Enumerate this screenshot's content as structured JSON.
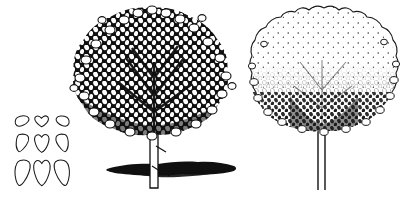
{
  "plate": {
    "title": "Tree rendering plate",
    "background_color": "#ffffff",
    "ink_color": "#111111",
    "medium": "pen-and-ink line drawing",
    "width": 403,
    "height": 198
  },
  "figures": [
    {
      "id": "leaf-chart",
      "name": "leaf-outline-grid",
      "label": "",
      "description": "Three-by-three grid of outlined leaf shapes, increasing in size from top row to bottom row",
      "rows": 3,
      "columns": 3,
      "fill": "none",
      "stroke_color": "#1a1a1a",
      "cells": [
        {
          "row": 1,
          "column": 1,
          "shape": "ovate-leaf-small",
          "size": "small"
        },
        {
          "row": 1,
          "column": 2,
          "shape": "cordate-leaf-small",
          "size": "small"
        },
        {
          "row": 1,
          "column": 3,
          "shape": "falcate-leaf-small",
          "size": "small"
        },
        {
          "row": 2,
          "column": 1,
          "shape": "ovate-leaf-medium",
          "size": "medium"
        },
        {
          "row": 2,
          "column": 2,
          "shape": "cordate-leaf-medium",
          "size": "medium"
        },
        {
          "row": 2,
          "column": 3,
          "shape": "falcate-leaf-medium",
          "size": "medium"
        },
        {
          "row": 3,
          "column": 1,
          "shape": "ovate-leaf-large",
          "size": "large"
        },
        {
          "row": 3,
          "column": 2,
          "shape": "cordate-leaf-large",
          "size": "large"
        },
        {
          "row": 3,
          "column": 3,
          "shape": "falcate-leaf-large",
          "size": "large"
        }
      ]
    },
    {
      "id": "tree-dark",
      "name": "dark-foliage-tree",
      "label": "",
      "description": "Deciduous tree with dense heavily inked rounded canopy, slender light trunk and a broad dark cast ground shadow",
      "canopy_style": "solid-dense-stamped-leaves",
      "canopy_tone": "dark",
      "has_ground_shadow": true,
      "trunk_style": "outlined-light-trunk",
      "trunk_color": "#ffffff"
    },
    {
      "id": "tree-light",
      "name": "light-foliage-tree",
      "label": "",
      "description": "Deciduous tree with open stippled canopy, pale outlined crown darkening toward the base, thin double-line trunk, no shadow",
      "canopy_style": "stippled-outline-leaves",
      "canopy_tone": "light",
      "has_ground_shadow": false,
      "trunk_style": "two-line-thin-trunk",
      "trunk_color": "#ffffff"
    }
  ]
}
